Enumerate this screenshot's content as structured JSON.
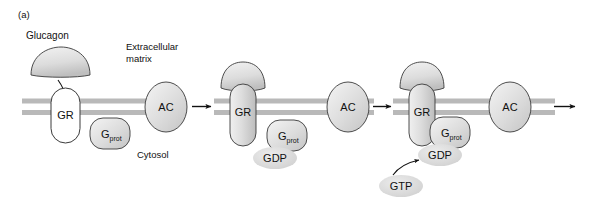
{
  "figure": {
    "panel_label": "(a)",
    "caption_extracellular": "Extracellular",
    "caption_extracellular2": "matrix",
    "caption_cytosol": "Cytosol",
    "ligand_label": "Glucagon"
  },
  "colors": {
    "membrane": "#b9b9b9",
    "outline": "#3a3a3a",
    "protein_fill_light": "#ffffff",
    "protein_fill_gray": "#d0d0d0",
    "nucleotide_fill": "#d8d8d8",
    "text": "#111111",
    "background": "#ffffff"
  },
  "stages": [
    {
      "id": "stage-1",
      "receptor_label": "GR",
      "receptor_activated": false,
      "gprotein_label": "G",
      "gprotein_sub": "prot",
      "effector_label": "AC",
      "nucleotide_bound": null,
      "ligand_present": true
    },
    {
      "id": "stage-2",
      "receptor_label": "GR",
      "receptor_activated": true,
      "gprotein_label": "G",
      "gprotein_sub": "prot",
      "effector_label": "AC",
      "nucleotide_bound": "GDP",
      "ligand_present": false
    },
    {
      "id": "stage-3",
      "receptor_label": "GR",
      "receptor_activated": true,
      "gprotein_label": "G",
      "gprotein_sub": "prot",
      "effector_label": "AC",
      "nucleotide_bound": "GDP",
      "incoming_nucleotide": "GTP",
      "ligand_present": false
    }
  ],
  "arrows": {
    "ligand_binding": "curved-arrow-glucagon-to-receptor",
    "transition_1_2": "arrow-right",
    "transition_2_3": "arrow-right",
    "transition_3_out": "arrow-right",
    "gtp_entry": "curved-arrow-gtp-to-gdp"
  }
}
